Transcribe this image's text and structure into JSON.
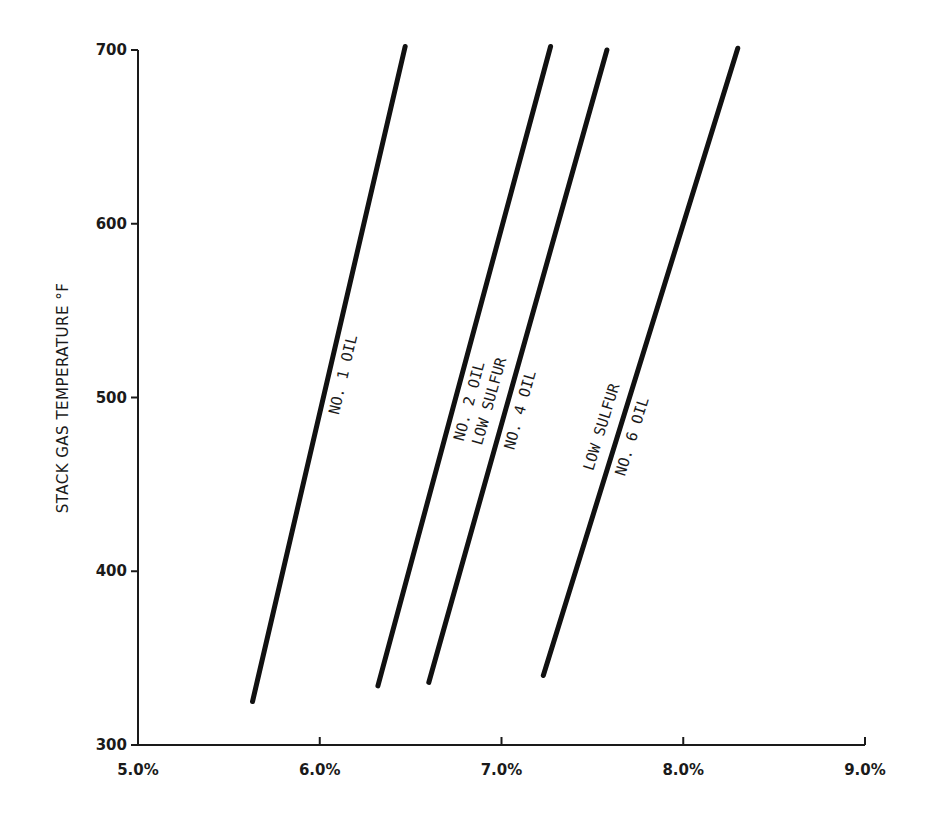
{
  "chart_data": {
    "type": "line",
    "title": "",
    "xlabel": "",
    "ylabel": "STACK GAS TEMPERATURE °F",
    "xlim": [
      5.0,
      9.0
    ],
    "ylim": [
      300,
      700
    ],
    "x_ticks": [
      5.0,
      6.0,
      7.0,
      8.0,
      9.0
    ],
    "x_tick_labels": [
      "5.0%",
      "6.0%",
      "7.0%",
      "8.0%",
      "9.0%"
    ],
    "y_ticks": [
      300,
      400,
      500,
      600,
      700
    ],
    "y_tick_labels": [
      "300",
      "400",
      "500",
      "600",
      "700"
    ],
    "grid": false,
    "legend": "none (inline labels on lines)",
    "series": [
      {
        "name": "NO. 1 OIL",
        "label_lines": [
          "NO. 1 OIL"
        ],
        "points": [
          [
            5.63,
            325
          ],
          [
            6.47,
            702
          ]
        ]
      },
      {
        "name": "NO. 2 OIL",
        "label_lines": [
          "NO. 2 OIL"
        ],
        "points": [
          [
            6.32,
            334
          ],
          [
            7.27,
            702
          ]
        ]
      },
      {
        "name": "NO. 4 OIL LOW SULFUR",
        "label_lines": [
          "NO. 4 OIL",
          "LOW SULFUR"
        ],
        "points": [
          [
            6.6,
            336
          ],
          [
            7.58,
            700
          ]
        ]
      },
      {
        "name": "NO. 6 OIL LOW SULFUR",
        "label_lines": [
          "NO. 6 OIL",
          "LOW SULFUR"
        ],
        "points": [
          [
            7.23,
            340
          ],
          [
            8.3,
            701
          ]
        ]
      }
    ]
  },
  "colors": {
    "line": "#111111",
    "axis": "#1a1a1a",
    "background": "#ffffff"
  }
}
